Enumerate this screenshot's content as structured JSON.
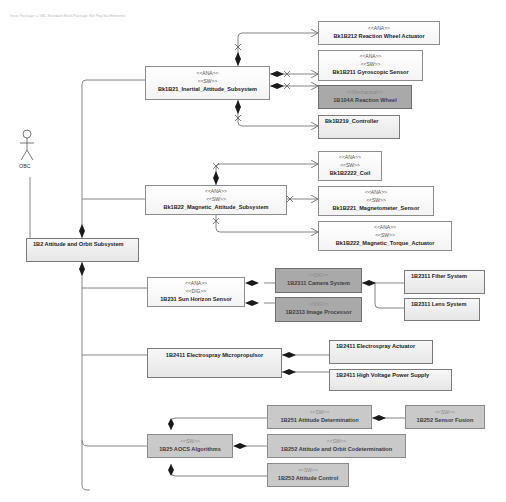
{
  "header": {
    "text": "Issue Package: = VBL Standard Block/Package Ref Pkg Sat Elements"
  },
  "actor": {
    "name": "OBC",
    "icon": "stick-figure-actor-icon"
  },
  "colors": {
    "line": "#6e6e6e",
    "white_block": "#ffffff",
    "light_block": "#ececec",
    "dark_block": "#a9a9a9",
    "mid_block": "#c9c9c9"
  },
  "blocks": {
    "aos": {
      "stereotypes": [],
      "name": "1B2 Attitude and Orbit Subsystem"
    },
    "inertial": {
      "stereotypes": [
        "<<ANA>>",
        "<<SW>>"
      ],
      "name": "Bk1B21_Inertial_Attitude_Subsystem"
    },
    "rw_actuator": {
      "stereotypes": [
        "<<ANA>>"
      ],
      "name": "Bk1B212 Reaction Wheel Actuator"
    },
    "gyro": {
      "stereotypes": [
        "<<ANA>>",
        "<<SW>>"
      ],
      "name": "Bk1B211 Gyroscopic Sensor"
    },
    "reaction_wheel": {
      "stereotypes": [
        "<<Mechanical>>"
      ],
      "name": "1B104A Reaction Wheel"
    },
    "controller": {
      "stereotypes": [],
      "name": "Bk1B219_Controller"
    },
    "magnetic": {
      "stereotypes": [
        "<<ANA>>",
        "<<SW>>"
      ],
      "name": "Bk1B22_Magnetic_Attitude_Subsystem"
    },
    "coil": {
      "stereotypes": [
        "<<ANA>>",
        "<<SW>>"
      ],
      "name": "Bk1B2222_Coil"
    },
    "magnetometer": {
      "stereotypes": [
        "<<ANA>>",
        "<<SW>>"
      ],
      "name": "Bk1B221_Magnetometer_Sensor"
    },
    "torque": {
      "stereotypes": [
        "<<ANA>>",
        "<<SW>>"
      ],
      "name": "Bk1B222_Magnetic_Torque_Actuator"
    },
    "sun": {
      "stereotypes": [
        "<<ANA>>",
        "<<DIG>>"
      ],
      "name": "1B231 Sun Horizon Sensor"
    },
    "camera": {
      "stereotypes": [
        "<<DIG>>"
      ],
      "name": "1B2311 Camera System"
    },
    "image_proc": {
      "stereotypes": [
        "<<DIG>>"
      ],
      "name": "1B2313 Image Processor"
    },
    "filter": {
      "stereotypes": [],
      "name": "1B2311 Filter System"
    },
    "lens": {
      "stereotypes": [],
      "name": "1B2311 Lens System"
    },
    "electrospray": {
      "stereotypes": [],
      "name": "1B2411 Electrospray Micropropulsor"
    },
    "es_actuator": {
      "stereotypes": [],
      "name": "1B2411 Electrospray Actuator"
    },
    "hv_supply": {
      "stereotypes": [],
      "name": "1B2411 High Voltage Power Supply"
    },
    "aocs": {
      "stereotypes": [
        "<<SW>>"
      ],
      "name": "1B25 AOCS Algorithms"
    },
    "att_det": {
      "stereotypes": [
        "<<SW>>"
      ],
      "name": "1B251 Attitude Determination"
    },
    "fusion": {
      "stereotypes": [
        "<<SW>>"
      ],
      "name": "1B252 Sensor Fusion"
    },
    "codet": {
      "stereotypes": [
        "<<SW>>"
      ],
      "name": "1B252 Attitude and Orbit Codetermination"
    },
    "control": {
      "stereotypes": [
        "<<SW>>"
      ],
      "name": "1B253 Attitude Control"
    }
  }
}
